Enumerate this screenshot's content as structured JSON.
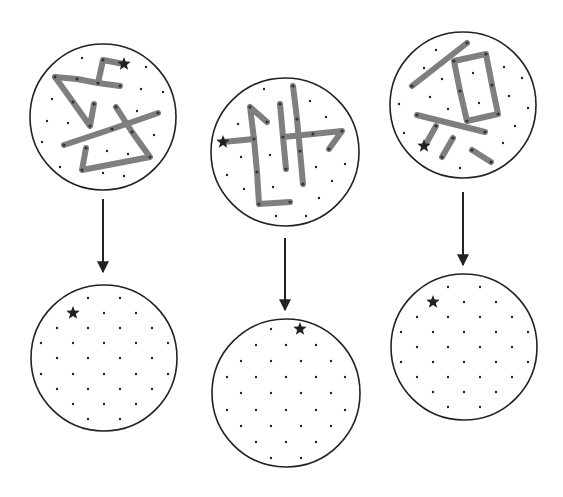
{
  "colors": {
    "background": "#ffffff",
    "outline": "#222222",
    "segment": "#7f7f7f",
    "dot": "#222222",
    "star": "#222222",
    "arrow": "#222222"
  },
  "panels": [
    {
      "id": "panel-1",
      "before": {
        "center": [
          103,
          117
        ],
        "r": 73,
        "star": [
          124,
          64
        ],
        "segments": [
          [
            [
              124,
              64
            ],
            [
              103,
              60
            ],
            [
              98,
              83
            ]
          ],
          [
            [
              55,
              77
            ],
            [
              77,
              79
            ],
            [
              98,
              83
            ],
            [
              120,
              86
            ]
          ],
          [
            [
              55,
              77
            ],
            [
              73,
              102
            ],
            [
              90,
              126
            ],
            [
              94,
              104
            ]
          ],
          [
            [
              116,
              107
            ],
            [
              132,
              132
            ],
            [
              150,
              157
            ],
            [
              82,
              170
            ],
            [
              86,
              148
            ]
          ],
          [
            [
              64,
              145
            ],
            [
              112,
              129
            ],
            [
              158,
              113
            ]
          ]
        ],
        "joints": [
          [
            103,
            60
          ],
          [
            98,
            83
          ],
          [
            120,
            86
          ],
          [
            77,
            79
          ],
          [
            55,
            77
          ],
          [
            73,
            102
          ],
          [
            90,
            126
          ],
          [
            94,
            104
          ],
          [
            116,
            107
          ],
          [
            132,
            132
          ],
          [
            150,
            157
          ],
          [
            82,
            170
          ],
          [
            86,
            148
          ],
          [
            64,
            145
          ],
          [
            112,
            129
          ],
          [
            158,
            113
          ]
        ],
        "dots": [
          [
            82,
            58
          ],
          [
            146,
            67
          ],
          [
            52,
            99
          ],
          [
            141,
            89
          ],
          [
            163,
            92
          ],
          [
            47,
            121
          ],
          [
            68,
            123
          ],
          [
            137,
            111
          ],
          [
            42,
            142
          ],
          [
            154,
            135
          ],
          [
            107,
            151
          ],
          [
            128,
            154
          ],
          [
            60,
            167
          ],
          [
            103,
            173
          ],
          [
            124,
            176
          ]
        ]
      },
      "arrow": {
        "x": 103,
        "y1": 199,
        "y2": 272
      },
      "after": {
        "center": [
          104,
          358
        ],
        "r": 73,
        "star": [
          73,
          313
        ],
        "dots": [
          [
            88,
            298
          ],
          [
            120,
            298
          ],
          [
            104,
            313
          ],
          [
            136,
            313
          ],
          [
            57,
            328
          ],
          [
            88,
            328
          ],
          [
            120,
            328
          ],
          [
            152,
            328
          ],
          [
            41,
            343
          ],
          [
            73,
            343
          ],
          [
            104,
            343
          ],
          [
            136,
            343
          ],
          [
            168,
            343
          ],
          [
            57,
            358
          ],
          [
            88,
            358
          ],
          [
            120,
            358
          ],
          [
            152,
            358
          ],
          [
            41,
            374
          ],
          [
            73,
            374
          ],
          [
            104,
            374
          ],
          [
            136,
            374
          ],
          [
            168,
            374
          ],
          [
            57,
            389
          ],
          [
            88,
            389
          ],
          [
            120,
            389
          ],
          [
            152,
            389
          ],
          [
            73,
            404
          ],
          [
            104,
            404
          ],
          [
            136,
            404
          ],
          [
            88,
            419
          ],
          [
            120,
            419
          ]
        ]
      }
    },
    {
      "id": "panel-2",
      "before": {
        "center": [
          285,
          152
        ],
        "r": 74,
        "star": [
          223,
          142
        ],
        "segments": [
          [
            [
              223,
              142
            ],
            [
              254,
              139
            ]
          ],
          [
            [
              267,
              122
            ],
            [
              250,
              107
            ],
            [
              254,
              139
            ],
            [
              257,
              172
            ],
            [
              259,
              204
            ],
            [
              290,
              202
            ]
          ],
          [
            [
              280,
              104
            ],
            [
              283,
              137
            ],
            [
              286,
              169
            ]
          ],
          [
            [
              293,
              86
            ],
            [
              297,
              119
            ],
            [
              300,
              151
            ],
            [
              303,
              184
            ]
          ],
          [
            [
              283,
              137
            ],
            [
              313,
              134
            ],
            [
              342,
              131
            ],
            [
              329,
              149
            ]
          ]
        ],
        "joints": [
          [
            254,
            139
          ],
          [
            250,
            107
          ],
          [
            267,
            122
          ],
          [
            257,
            172
          ],
          [
            259,
            204
          ],
          [
            290,
            202
          ],
          [
            280,
            104
          ],
          [
            283,
            137
          ],
          [
            286,
            169
          ],
          [
            293,
            86
          ],
          [
            297,
            119
          ],
          [
            300,
            151
          ],
          [
            303,
            184
          ],
          [
            313,
            134
          ],
          [
            342,
            131
          ],
          [
            329,
            149
          ]
        ],
        "dots": [
          [
            264,
            89
          ],
          [
            310,
            101
          ],
          [
            326,
            117
          ],
          [
            238,
            124
          ],
          [
            241,
            157
          ],
          [
            270,
            155
          ],
          [
            316,
            167
          ],
          [
            345,
            164
          ],
          [
            227,
            175
          ],
          [
            332,
            181
          ],
          [
            244,
            189
          ],
          [
            273,
            187
          ],
          [
            319,
            198
          ],
          [
            276,
            216
          ],
          [
            306,
            216
          ]
        ]
      },
      "arrow": {
        "x": 285,
        "y1": 238,
        "y2": 310
      },
      "after": {
        "center": [
          286,
          393
        ],
        "r": 74,
        "star": [
          300,
          329
        ],
        "dots": [
          [
            271,
            329
          ],
          [
            256,
            345
          ],
          [
            286,
            345
          ],
          [
            316,
            345
          ],
          [
            241,
            361
          ],
          [
            271,
            361
          ],
          [
            301,
            361
          ],
          [
            331,
            361
          ],
          [
            227,
            377
          ],
          [
            256,
            377
          ],
          [
            286,
            377
          ],
          [
            316,
            377
          ],
          [
            345,
            377
          ],
          [
            241,
            393
          ],
          [
            271,
            393
          ],
          [
            301,
            393
          ],
          [
            331,
            393
          ],
          [
            227,
            410
          ],
          [
            256,
            410
          ],
          [
            286,
            410
          ],
          [
            316,
            410
          ],
          [
            345,
            410
          ],
          [
            241,
            426
          ],
          [
            271,
            426
          ],
          [
            301,
            426
          ],
          [
            331,
            426
          ],
          [
            256,
            442
          ],
          [
            286,
            442
          ],
          [
            316,
            442
          ],
          [
            271,
            458
          ],
          [
            301,
            458
          ]
        ]
      }
    },
    {
      "id": "panel-3",
      "before": {
        "center": [
          463,
          105
        ],
        "r": 73,
        "star": [
          424,
          146
        ],
        "segments": [
          [
            [
              412,
              86
            ],
            [
              467,
              43
            ]
          ],
          [
            [
              454,
              61
            ],
            [
              486,
              54
            ],
            [
              492,
              85
            ],
            [
              498,
              114
            ],
            [
              467,
              121
            ],
            [
              460,
              91
            ],
            [
              454,
              61
            ]
          ],
          [
            [
              417,
              115
            ],
            [
              485,
              132
            ]
          ],
          [
            [
              436,
              126
            ],
            [
              427,
              142
            ]
          ],
          [
            [
              453,
              138
            ],
            [
              442,
              157
            ]
          ],
          [
            [
              472,
              150
            ],
            [
              491,
              162
            ]
          ]
        ],
        "joints": [
          [
            412,
            86
          ],
          [
            467,
            43
          ],
          [
            454,
            61
          ],
          [
            486,
            54
          ],
          [
            492,
            85
          ],
          [
            498,
            114
          ],
          [
            467,
            121
          ],
          [
            460,
            91
          ],
          [
            417,
            115
          ],
          [
            485,
            132
          ],
          [
            436,
            126
          ],
          [
            453,
            138
          ],
          [
            442,
            157
          ],
          [
            472,
            150
          ],
          [
            491,
            162
          ]
        ],
        "dots": [
          [
            436,
            50
          ],
          [
            424,
            68
          ],
          [
            442,
            79
          ],
          [
            473,
            73
          ],
          [
            504,
            67
          ],
          [
            522,
            78
          ],
          [
            430,
            97
          ],
          [
            479,
            103
          ],
          [
            509,
            96
          ],
          [
            399,
            104
          ],
          [
            448,
            109
          ],
          [
            528,
            108
          ],
          [
            515,
            126
          ],
          [
            404,
            133
          ],
          [
            503,
            143
          ],
          [
            460,
            168
          ]
        ]
      },
      "arrow": {
        "x": 463,
        "y1": 192,
        "y2": 265
      },
      "after": {
        "center": [
          464,
          347
        ],
        "r": 73,
        "star": [
          433,
          302
        ],
        "dots": [
          [
            448,
            287
          ],
          [
            480,
            287
          ],
          [
            464,
            302
          ],
          [
            496,
            302
          ],
          [
            417,
            317
          ],
          [
            448,
            317
          ],
          [
            480,
            317
          ],
          [
            512,
            317
          ],
          [
            401,
            332
          ],
          [
            433,
            332
          ],
          [
            464,
            332
          ],
          [
            496,
            332
          ],
          [
            528,
            332
          ],
          [
            417,
            347
          ],
          [
            448,
            347
          ],
          [
            480,
            347
          ],
          [
            512,
            347
          ],
          [
            401,
            362
          ],
          [
            433,
            362
          ],
          [
            464,
            362
          ],
          [
            496,
            362
          ],
          [
            528,
            362
          ],
          [
            417,
            377
          ],
          [
            448,
            377
          ],
          [
            480,
            377
          ],
          [
            512,
            377
          ],
          [
            433,
            392
          ],
          [
            464,
            392
          ],
          [
            496,
            392
          ],
          [
            448,
            407
          ],
          [
            480,
            407
          ]
        ]
      }
    }
  ]
}
